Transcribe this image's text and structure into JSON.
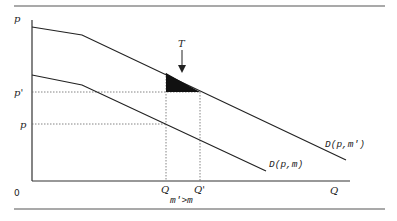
{
  "diagram": {
    "axes": {
      "y_label": "p",
      "x_label": "Q",
      "origin_label": "0"
    },
    "price_levels": {
      "high": "p'",
      "low": "p"
    },
    "quantity_levels": {
      "low": "Q",
      "high": "Q'"
    },
    "curves": [
      {
        "name": "upper-demand",
        "label": "D(p,m')"
      },
      {
        "name": "lower-demand",
        "label": "D(p,m)"
      }
    ],
    "annotation": {
      "arrow_label": "T",
      "condition": "m'>m"
    },
    "colors": {
      "line": "#222222",
      "rule": "#555555",
      "fill": "#111111"
    }
  }
}
